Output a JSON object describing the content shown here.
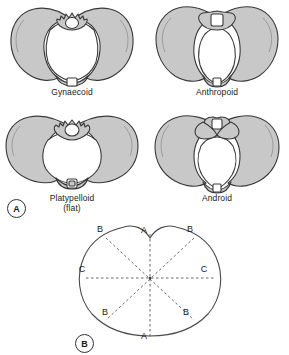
{
  "figure": {
    "background_color": "#ffffff",
    "bone_fill_color": "#c8c8c8",
    "outline_color": "#333333"
  },
  "panel_a": {
    "marker": "A",
    "caption": "Four classic pelvic shapes viewed from above",
    "pelvis_types": [
      {
        "name": "Gynaecoid",
        "label": "Gynaecoid",
        "sublabel": "",
        "inlet_shape": "rounded-oval",
        "description": "Rounded, slightly transverse oval inlet; typical female pelvis"
      },
      {
        "name": "Anthropoid",
        "label": "Anthropoid",
        "sublabel": "",
        "inlet_shape": "long-oval",
        "description": "Anteroposteriorly elongated oval inlet"
      },
      {
        "name": "Platypelloid",
        "label": "Platypelloid",
        "sublabel": "(flat)",
        "inlet_shape": "wide-flat-oval",
        "description": "Wide, flattened transverse oval inlet"
      },
      {
        "name": "Android",
        "label": "Android",
        "sublabel": "",
        "inlet_shape": "heart-wedge",
        "description": "Heart shaped, wedge like inlet; typical male pelvis"
      }
    ]
  },
  "panel_b": {
    "marker": "B",
    "caption": "Diameters of the pelvic brim",
    "shape": "heart-shaped pelvic brim outline",
    "diameter_labels": [
      {
        "id": "A-top",
        "text": "A",
        "position": "top-centre",
        "x": 144,
        "y": 230
      },
      {
        "id": "A-bottom",
        "text": "A",
        "position": "bottom-centre",
        "x": 144,
        "y": 336
      },
      {
        "id": "B-top-left",
        "text": "B",
        "position": "top-left",
        "x": 100,
        "y": 229
      },
      {
        "id": "B-top-right",
        "text": "B",
        "position": "top-right",
        "x": 190,
        "y": 229
      },
      {
        "id": "B-bot-left",
        "text": "B",
        "position": "bottom-left",
        "x": 105,
        "y": 312
      },
      {
        "id": "B-bot-right",
        "text": "B",
        "position": "bottom-right",
        "x": 186,
        "y": 312
      },
      {
        "id": "C-left",
        "text": "C",
        "position": "left",
        "x": 82,
        "y": 269
      },
      {
        "id": "C-right",
        "text": "C",
        "position": "right",
        "x": 204,
        "y": 269
      }
    ],
    "diameters": [
      {
        "label": "A",
        "name": "anteroposterior diameter",
        "orientation": "vertical"
      },
      {
        "label": "B",
        "name": "oblique diameters",
        "orientation": "oblique"
      },
      {
        "label": "C",
        "name": "transverse diameter",
        "orientation": "horizontal"
      }
    ]
  }
}
